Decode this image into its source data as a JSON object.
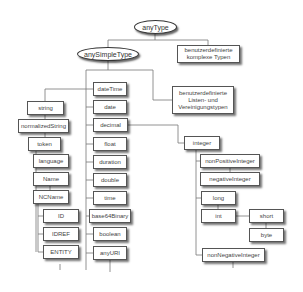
{
  "diagram": {
    "root": {
      "label": "anyType"
    },
    "any_simple_type": {
      "label": "anySimpleType"
    },
    "complex_types": {
      "label": "benutzerdefinierte komplexe Typen"
    },
    "list_union_types": {
      "label": "benutzerdefinierte Listen- und Vereinigungstypen"
    },
    "string_branch": [
      {
        "label": "string"
      },
      {
        "label": "normalizedString"
      },
      {
        "label": "token"
      },
      {
        "label": "language"
      },
      {
        "label": "Name"
      },
      {
        "label": "NCName"
      },
      {
        "label": "ID"
      },
      {
        "label": "IDREF"
      },
      {
        "label": "ENTITY"
      }
    ],
    "primitive_column": [
      {
        "label": "dateTime"
      },
      {
        "label": "date"
      },
      {
        "label": "decimal"
      },
      {
        "label": "float"
      },
      {
        "label": "duration"
      },
      {
        "label": "double"
      },
      {
        "label": "time"
      },
      {
        "label": "base64Binary"
      },
      {
        "label": "boolean"
      },
      {
        "label": "anyURI"
      }
    ],
    "integer_branch": {
      "integer": {
        "label": "integer"
      },
      "nonPositiveInteger": {
        "label": "nonPositiveInteger"
      },
      "negativeInteger": {
        "label": "negativeInteger"
      },
      "long": {
        "label": "long"
      },
      "int": {
        "label": "int"
      },
      "short": {
        "label": "short"
      },
      "byte": {
        "label": "byte"
      },
      "nonNegativeInteger": {
        "label": "nonNegativeInteger"
      }
    }
  }
}
